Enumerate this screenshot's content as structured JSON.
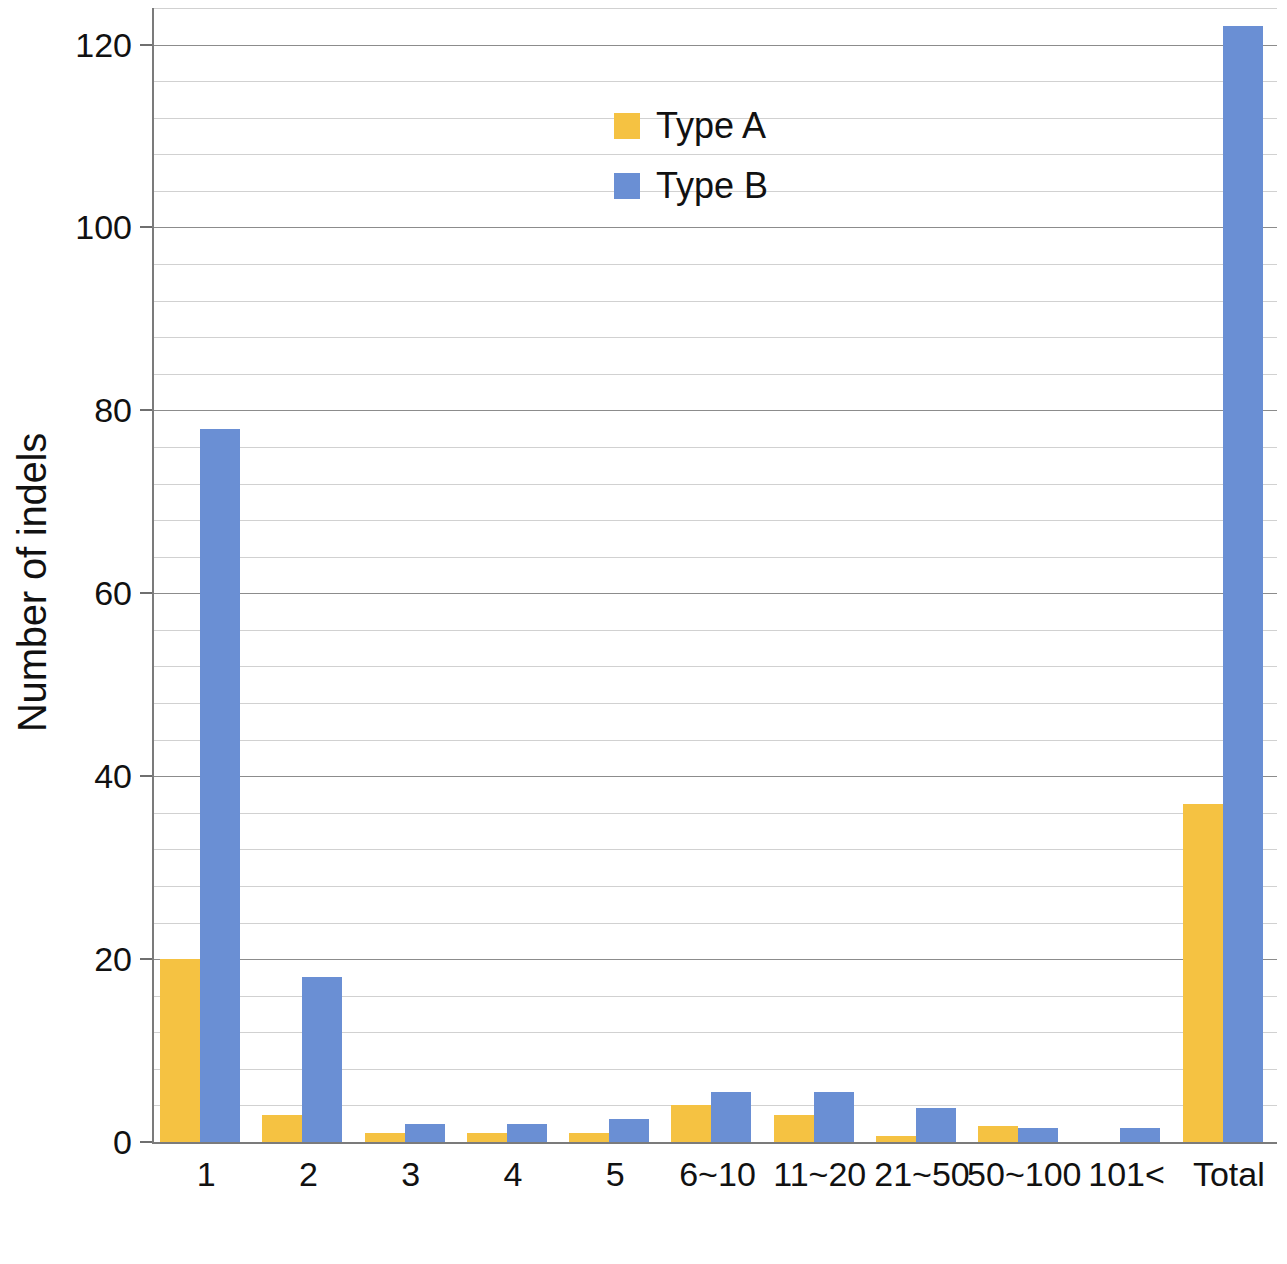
{
  "chart_data": {
    "type": "bar",
    "title": "",
    "subtitle": "",
    "xlabel": "Length of indels (bp)",
    "ylabel": "Number of indels",
    "categories": [
      "1",
      "2",
      "3",
      "4",
      "5",
      "6~10",
      "11~20",
      "21~50",
      "50~100",
      "101<",
      "Total"
    ],
    "series": [
      {
        "name": "Type A",
        "color": "#F5C242",
        "values": [
          20,
          3,
          1,
          1,
          1,
          4,
          3,
          0.7,
          1.7,
          0,
          37
        ]
      },
      {
        "name": "Type B",
        "color": "#6A8FD4",
        "values": [
          78,
          18,
          2,
          2,
          2.5,
          5.5,
          5.5,
          3.7,
          1.5,
          1.5,
          122
        ]
      }
    ],
    "ylim": [
      0,
      124
    ],
    "y_major_ticks": [
      0,
      20,
      40,
      60,
      80,
      100,
      120
    ],
    "y_major_tick_labels": [
      "0",
      "20",
      "40",
      "60",
      "80",
      "100",
      "120"
    ],
    "y_minor_tick_interval": 4,
    "grid": "horizontal",
    "legend_position": "inside-top-center",
    "legend": [
      {
        "label": "Type A",
        "color": "#F5C242"
      },
      {
        "label": "Type B",
        "color": "#6A8FD4"
      }
    ]
  },
  "axis": {
    "x_title": "Length of indels (bp)",
    "y_title": "Number of indels"
  }
}
